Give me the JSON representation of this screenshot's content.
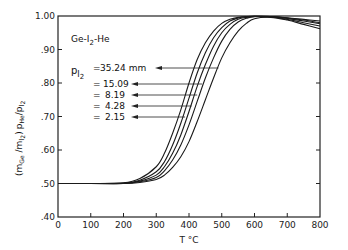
{
  "chart_data": {
    "type": "line",
    "title": "Ge-I2-He",
    "xlabel": "T °C",
    "ylabel": "(mGe / mI2) pHe / pI2",
    "xlim": [
      0,
      800
    ],
    "ylim": [
      0.4,
      1.0
    ],
    "x_ticks": [
      "0",
      "100",
      "200",
      "300",
      "400",
      "500",
      "600",
      "700",
      "800"
    ],
    "y_ticks": [
      ".40",
      ".50",
      ".60",
      ".70",
      ".80",
      ".90",
      "1.00"
    ],
    "grid": false,
    "legend_label": "pI2",
    "x": [
      0,
      100,
      200,
      250,
      300,
      325,
      350,
      375,
      400,
      425,
      450,
      475,
      500,
      525,
      550,
      575,
      600,
      650,
      700,
      750,
      800
    ],
    "series": [
      {
        "name": "2.15",
        "values": [
          0.5,
          0.5,
          0.502,
          0.515,
          0.55,
          0.59,
          0.65,
          0.72,
          0.8,
          0.87,
          0.92,
          0.955,
          0.978,
          0.99,
          0.996,
          0.998,
          0.999,
          0.998,
          0.995,
          0.99,
          0.985
        ],
        "arrow_at": {
          "T": 388,
          "y": 0.71
        }
      },
      {
        "name": "4.28",
        "values": [
          0.5,
          0.5,
          0.501,
          0.51,
          0.535,
          0.565,
          0.615,
          0.68,
          0.755,
          0.83,
          0.89,
          0.935,
          0.965,
          0.985,
          0.994,
          0.998,
          0.999,
          0.998,
          0.994,
          0.988,
          0.98
        ],
        "arrow_at": {
          "T": 408,
          "y": 0.74
        }
      },
      {
        "name": "8.19",
        "values": [
          0.5,
          0.5,
          0.5,
          0.507,
          0.525,
          0.55,
          0.59,
          0.645,
          0.715,
          0.79,
          0.855,
          0.91,
          0.95,
          0.975,
          0.99,
          0.996,
          0.999,
          0.998,
          0.993,
          0.985,
          0.977
        ],
        "arrow_at": {
          "T": 425,
          "y": 0.77
        }
      },
      {
        "name": "15.09",
        "values": [
          0.5,
          0.5,
          0.5,
          0.505,
          0.518,
          0.538,
          0.57,
          0.615,
          0.675,
          0.745,
          0.815,
          0.875,
          0.925,
          0.96,
          0.982,
          0.993,
          0.998,
          0.997,
          0.99,
          0.98,
          0.97
        ],
        "arrow_at": {
          "T": 440,
          "y": 0.8
        }
      },
      {
        "name": "35.24 mm",
        "values": [
          0.5,
          0.5,
          0.5,
          0.503,
          0.512,
          0.525,
          0.548,
          0.58,
          0.625,
          0.685,
          0.75,
          0.815,
          0.875,
          0.92,
          0.955,
          0.978,
          0.992,
          0.996,
          0.988,
          0.975,
          0.962
        ],
        "arrow_at": {
          "T": 490,
          "y": 0.86
        }
      }
    ]
  },
  "annotations": {
    "system": "Ge-I",
    "system_sub": "2",
    "system_tail": "-He",
    "p_label": "p",
    "p_sub": "I",
    "p_sub2": "2",
    "items": [
      {
        "prefix": "=",
        "value": "35.24 mm"
      },
      {
        "prefix": "=",
        "value": "15.09"
      },
      {
        "prefix": "=",
        "value": "8.19"
      },
      {
        "prefix": "=",
        "value": "4.28"
      },
      {
        "prefix": "=",
        "value": "2.15"
      }
    ]
  },
  "axes": {
    "xlabel": "T °C",
    "ylabel_parts": {
      "open": "(m",
      "ge": "Ge",
      "slash": " /m",
      "i2": "I",
      "two": "2",
      "close": ")",
      "phe": "p",
      "he": "He",
      "div": "/p",
      "pi": "I",
      "pi2": "2"
    }
  }
}
